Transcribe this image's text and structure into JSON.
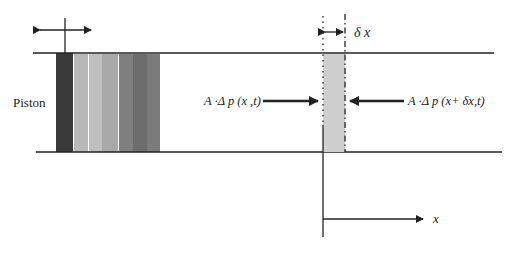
{
  "diagram": {
    "type": "piston-tube-element",
    "labels": {
      "piston": "Piston",
      "left_force": "A ·Δ p (x ,t)",
      "right_force": "A ·Δ p (x+ δx,t)",
      "delta_x": "δ x",
      "x_axis": "x"
    },
    "colors": {
      "line": "#222222",
      "element_fill": "#cfcfcf",
      "piston_bars": [
        "#3a3a3a",
        "#b8b8b8",
        "#bfbfbf",
        "#a9a9a9",
        "#7f7f7f",
        "#6d6d6d",
        "#7b7b7b"
      ]
    }
  }
}
